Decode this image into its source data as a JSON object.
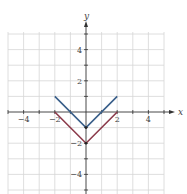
{
  "chart_data": {
    "type": "line",
    "title": "",
    "xlabel": "x",
    "ylabel": "y",
    "xlim": [
      -5,
      5
    ],
    "ylim": [
      -5,
      5
    ],
    "grid": true,
    "x_ticks": [
      -4,
      -2,
      2,
      4
    ],
    "y_ticks": [
      4,
      2,
      -2,
      -4
    ],
    "x_tick_labels": [
      "−4",
      "−2",
      "2",
      "4"
    ],
    "y_tick_labels": [
      "4",
      "2",
      "−2",
      "−4"
    ],
    "series": [
      {
        "name": "y = |x| - 1",
        "color": "#3a5f8a",
        "x": [
          -2,
          0,
          2
        ],
        "y": [
          1,
          -1,
          1
        ]
      },
      {
        "name": "y = |x| - 2",
        "color": "#8b3a4a",
        "x": [
          -2,
          0,
          2
        ],
        "y": [
          0,
          -2,
          0
        ]
      }
    ]
  },
  "colors": {
    "grid": "#d6d6d6",
    "axis": "#333333"
  }
}
